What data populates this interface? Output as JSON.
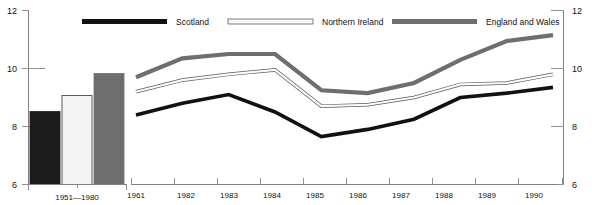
{
  "chart_data": {
    "type": "line",
    "title": "",
    "xlabel": "",
    "ylabel": "",
    "ylim": [
      6,
      12
    ],
    "yticks": [
      6,
      8,
      10,
      12
    ],
    "grid": false,
    "legend_position": "top",
    "legend": [
      "Scotland",
      "Northern Ireland",
      "England and Wales"
    ],
    "x": [
      1961,
      1962,
      1963,
      1964,
      1965,
      1966,
      1967,
      1968,
      1989,
      1990
    ],
    "categories": [
      "1961",
      "1982",
      "1983",
      "1984",
      "1985",
      "1986",
      "1987",
      "1988",
      "1989",
      "1990"
    ],
    "series": [
      {
        "name": "Scotland",
        "color": "#111111",
        "values": [
          8.4,
          8.8,
          9.1,
          8.5,
          7.65,
          7.9,
          8.25,
          9.0,
          9.15,
          9.35
        ]
      },
      {
        "name": "Northern Ireland",
        "color": "#f2f2f2",
        "values": [
          9.2,
          9.6,
          9.8,
          9.95,
          8.7,
          8.75,
          9.0,
          9.45,
          9.5,
          9.8
        ]
      },
      {
        "name": "England and Wales",
        "color": "#6e6e6e",
        "values": [
          9.7,
          10.35,
          10.5,
          10.5,
          9.25,
          9.15,
          9.5,
          10.3,
          10.95,
          11.15
        ]
      }
    ],
    "inset_bar_chart": {
      "type": "bar",
      "category": "1951—1980",
      "bars": [
        {
          "name": "Scotland",
          "value": 8.5,
          "color": "#111111"
        },
        {
          "name": "Northern Ireland",
          "value": 9.05,
          "color": "#f2f2f2"
        },
        {
          "name": "England and Wales",
          "value": 9.8,
          "color": "#6e6e6e"
        }
      ]
    }
  },
  "axes": {
    "left": {
      "labels": [
        "12",
        "10",
        "8",
        "6"
      ]
    },
    "right": {
      "labels": [
        "12",
        "10",
        "8",
        "6"
      ]
    }
  },
  "legend": {
    "items": [
      {
        "label": "Scotland",
        "swatch": "#111111",
        "style": "solid-black"
      },
      {
        "label": "Northern Ireland",
        "swatch": "#f5f5f5",
        "style": "outlined-white"
      },
      {
        "label": "England and Wales",
        "swatch": "#6e6e6e",
        "style": "solid-gray"
      }
    ]
  },
  "bar_panel": {
    "x_label": "1951—1980"
  },
  "line_panel": {
    "year_labels": [
      "1961",
      "1982",
      "1983",
      "1984",
      "1985",
      "1986",
      "1987",
      "1988",
      "1989",
      "1990"
    ]
  }
}
